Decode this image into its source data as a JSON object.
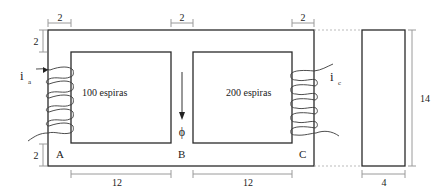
{
  "diagram": {
    "core": {
      "windows": 2,
      "legs": [
        {
          "label": "A",
          "position": "left"
        },
        {
          "label": "B",
          "position": "center"
        },
        {
          "label": "C",
          "position": "right"
        }
      ]
    },
    "coils": [
      {
        "leg": "A",
        "turns_label": "100 espiras",
        "current_label": "i",
        "current_subscript": "a"
      },
      {
        "leg": "C",
        "turns_label": "200 espiras",
        "current_label": "i",
        "current_subscript": "c"
      }
    ],
    "flux": {
      "symbol": "ϕ",
      "leg": "B",
      "direction": "down"
    },
    "dimensions": {
      "top_left_width": "2",
      "top_center_width": "2",
      "top_right_width": "2",
      "left_top_height": "2",
      "left_bottom_height": "2",
      "window_left_width": "12",
      "window_right_width": "12",
      "side_height": "14",
      "side_depth": "4"
    },
    "labels": {
      "A": "A",
      "B": "B",
      "C": "C"
    }
  }
}
